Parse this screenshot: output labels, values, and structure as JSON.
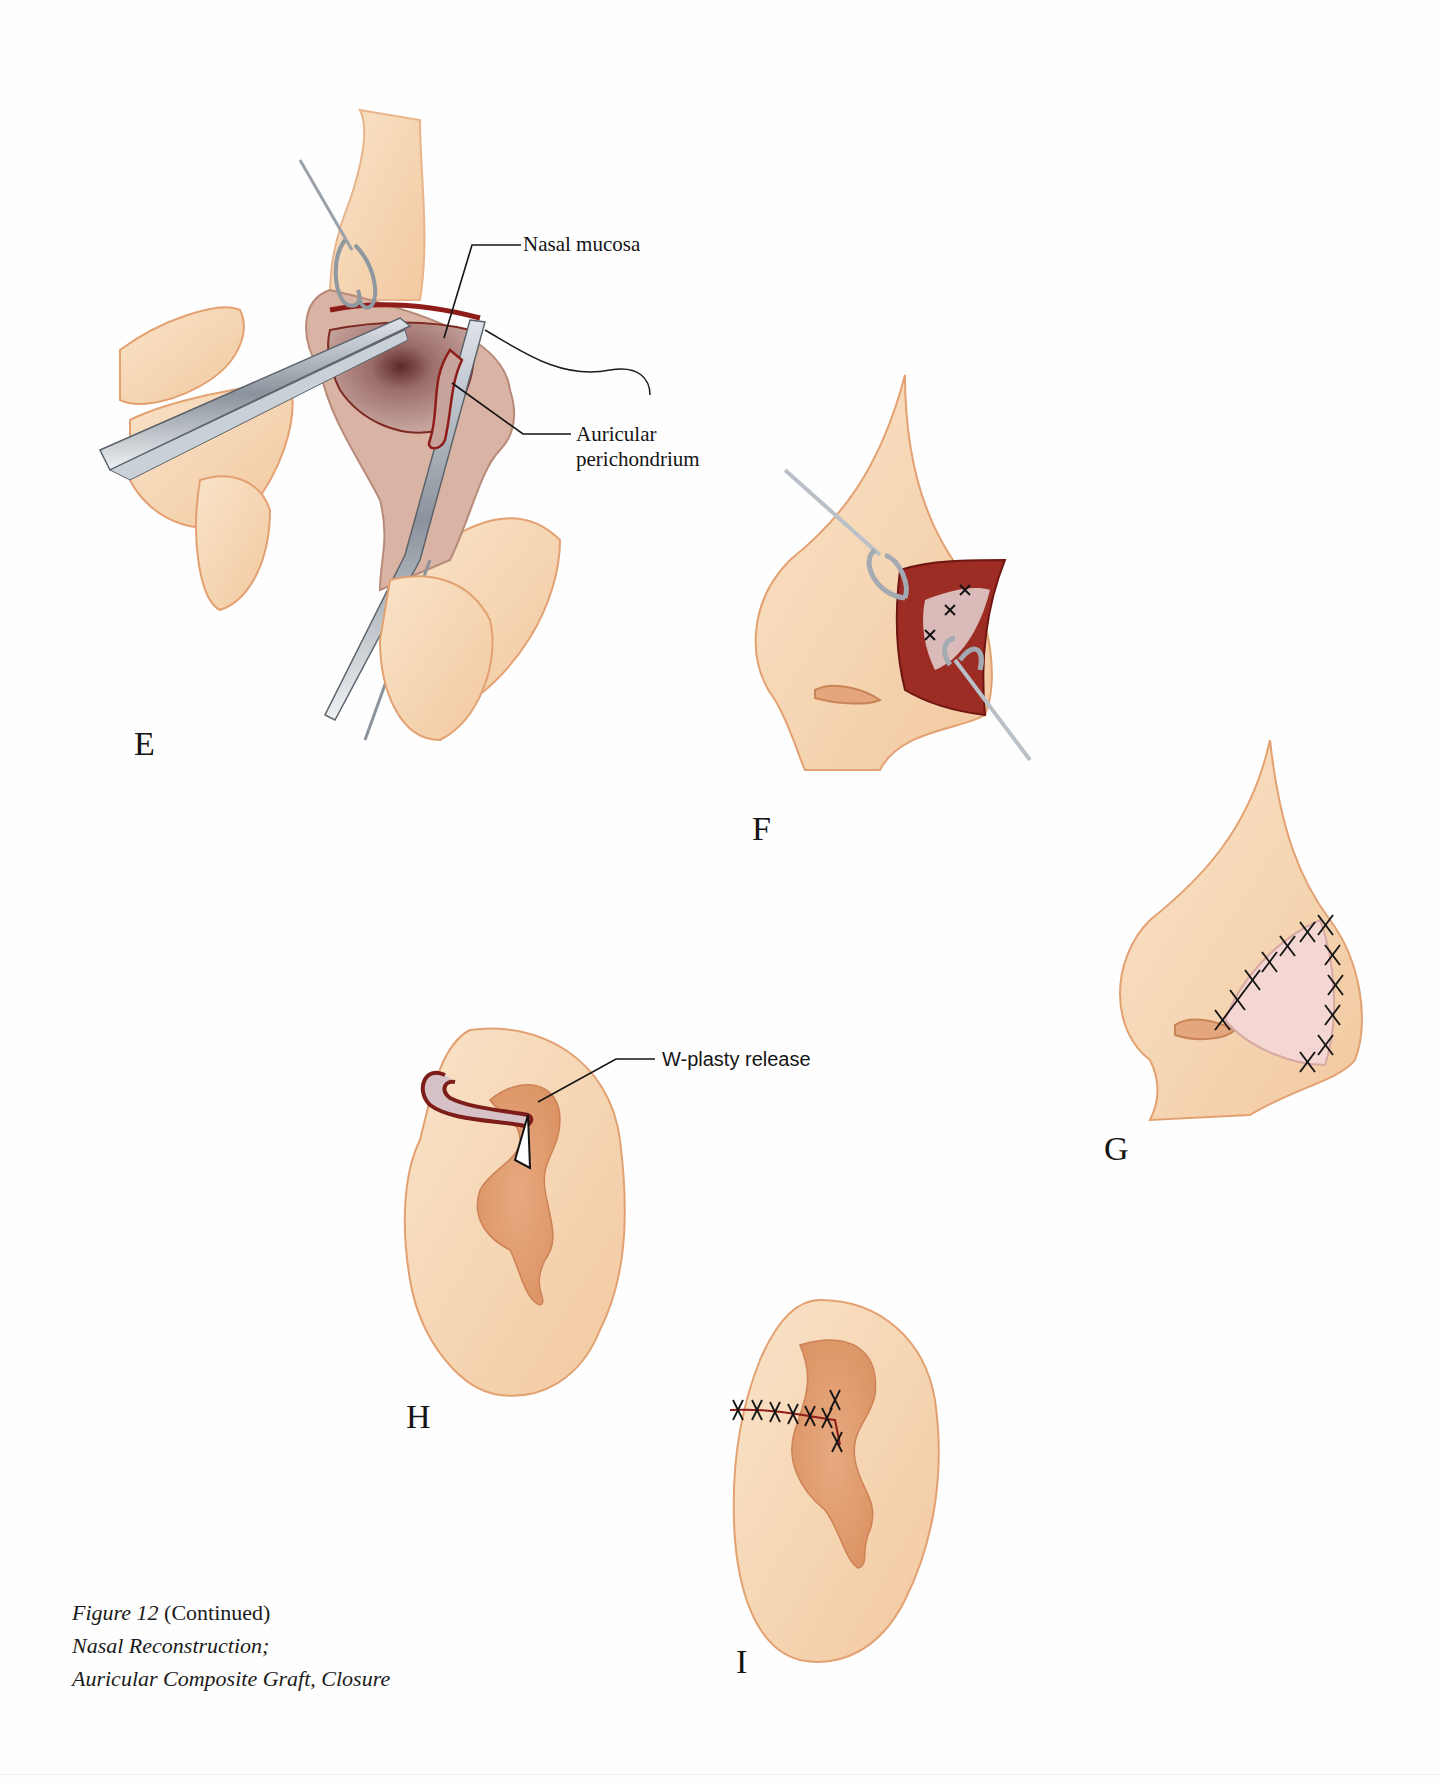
{
  "figure": {
    "number_label": "Figure 12",
    "continued": "(Continued)",
    "title_line1": "Nasal Reconstruction;",
    "title_line2": "Auricular Composite Graft, Closure"
  },
  "panels": [
    {
      "letter": "E",
      "description": "Auricular composite graft sutured to nasal mucosa with forceps and needle holder"
    },
    {
      "letter": "F",
      "description": "Graft inset in alar defect with skin hooks"
    },
    {
      "letter": "G",
      "description": "Closure of nasal ala with interrupted sutures"
    },
    {
      "letter": "H",
      "description": "Donor ear with W-plasty release"
    },
    {
      "letter": "I",
      "description": "Donor ear closed with sutures"
    }
  ],
  "annotations": {
    "nasal_mucosa": "Nasal mucosa",
    "auricular_line1": "Auricular",
    "auricular_line2": "perichondrium",
    "w_plasty": "W-plasty release"
  },
  "colors": {
    "skin_fill": "#f7d9b8",
    "skin_edge": "#e3a172",
    "tissue_red": "#8e1d1a",
    "mucosa": "#b88a86",
    "steel": "#b9c0c8",
    "ink": "#141414"
  }
}
